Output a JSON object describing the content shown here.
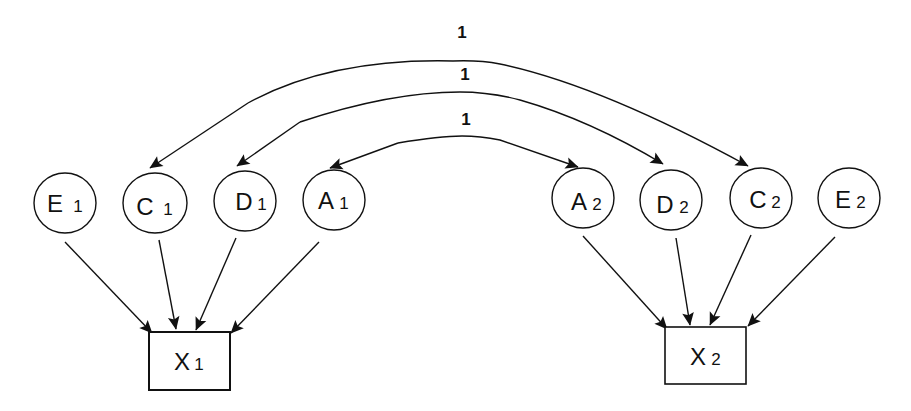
{
  "diagram": {
    "type": "path-diagram",
    "latent_nodes": [
      {
        "id": "E1",
        "letter": "E",
        "sub": "1",
        "cx": 65,
        "cy": 203
      },
      {
        "id": "C1",
        "letter": "C",
        "sub": "1",
        "cx": 155,
        "cy": 203
      },
      {
        "id": "D1",
        "letter": "D",
        "sub": "1",
        "cx": 245,
        "cy": 201
      },
      {
        "id": "A1",
        "letter": "A",
        "sub": "1",
        "cx": 334,
        "cy": 200
      },
      {
        "id": "A2",
        "letter": "A",
        "sub": "2",
        "cx": 583,
        "cy": 198
      },
      {
        "id": "D2",
        "letter": "D",
        "sub": "2",
        "cx": 671,
        "cy": 200
      },
      {
        "id": "C2",
        "letter": "C",
        "sub": "2",
        "cx": 761,
        "cy": 198
      },
      {
        "id": "E2",
        "letter": "E",
        "sub": "2",
        "cx": 849,
        "cy": 198
      }
    ],
    "observed_nodes": [
      {
        "id": "X1",
        "letter": "X",
        "sub": "1"
      },
      {
        "id": "X2",
        "letter": "X",
        "sub": "2"
      }
    ],
    "correlation_labels": [
      "1",
      "1",
      "1"
    ],
    "correlations": [
      {
        "from": "C1",
        "to": "C2",
        "label": "1"
      },
      {
        "from": "D1",
        "to": "D2",
        "label": "1"
      },
      {
        "from": "A1",
        "to": "A2",
        "label": "1"
      }
    ],
    "paths": [
      {
        "from": "E1",
        "to": "X1"
      },
      {
        "from": "C1",
        "to": "X1"
      },
      {
        "from": "D1",
        "to": "X1"
      },
      {
        "from": "A1",
        "to": "X1"
      },
      {
        "from": "A2",
        "to": "X2"
      },
      {
        "from": "D2",
        "to": "X2"
      },
      {
        "from": "C2",
        "to": "X2"
      },
      {
        "from": "E2",
        "to": "X2"
      }
    ]
  }
}
